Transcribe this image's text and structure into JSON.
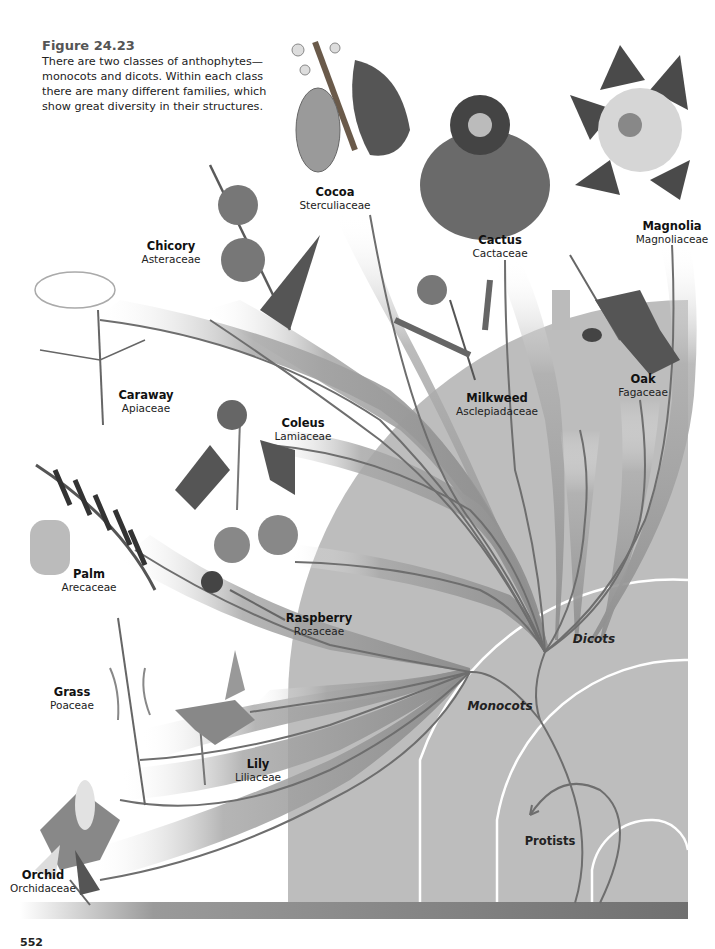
{
  "figure": {
    "title": "Figure 24.23",
    "caption": "There are two classes of anthophytes—monocots and dicots. Within each class there are many different families, which show great diversity in their structures."
  },
  "clades": {
    "dicots": "Dicots",
    "monocots": "Monocots",
    "protists": "Protists"
  },
  "plants": [
    {
      "id": "cocoa",
      "common": "Cocoa",
      "family": "Sterculiaceae",
      "x": 335,
      "y": 186
    },
    {
      "id": "cactus",
      "common": "Cactus",
      "family": "Cactaceae",
      "x": 500,
      "y": 234
    },
    {
      "id": "magnolia",
      "common": "Magnolia",
      "family": "Magnoliaceae",
      "x": 688,
      "y": 220
    },
    {
      "id": "chicory",
      "common": "Chicory",
      "family": "Asteraceae",
      "x": 171,
      "y": 240
    },
    {
      "id": "caraway",
      "common": "Caraway",
      "family": "Apiaceae",
      "x": 146,
      "y": 389
    },
    {
      "id": "milkweed",
      "common": "Milkweed",
      "family": "Asclepiadaceae",
      "x": 497,
      "y": 392
    },
    {
      "id": "oak",
      "common": "Oak",
      "family": "Fagaceae",
      "x": 643,
      "y": 373
    },
    {
      "id": "coleus",
      "common": "Coleus",
      "family": "Lamiaceae",
      "x": 303,
      "y": 417
    },
    {
      "id": "palm",
      "common": "Palm",
      "family": "Arecaceae",
      "x": 89,
      "y": 568
    },
    {
      "id": "raspberry",
      "common": "Raspberry",
      "family": "Rosaceae",
      "x": 319,
      "y": 612
    },
    {
      "id": "grass",
      "common": "Grass",
      "family": "Poaceae",
      "x": 72,
      "y": 686
    },
    {
      "id": "lily",
      "common": "Lily",
      "family": "Liliaceae",
      "x": 258,
      "y": 758
    },
    {
      "id": "orchid",
      "common": "Orchid",
      "family": "Orchidaceae",
      "x": 43,
      "y": 869
    }
  ],
  "page_number": "552",
  "colors": {
    "background_region": "#b9b9b9",
    "ground_bar": "#7a7a7a",
    "branch_line": "#6b6b6b",
    "ribbon": "#9a9a9a",
    "arc_line": "#ffffff"
  }
}
